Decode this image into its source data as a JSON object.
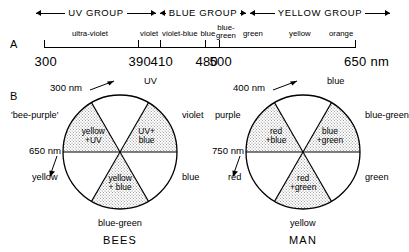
{
  "panels": {
    "a_label": "A",
    "b_label": "B"
  },
  "spectrum": {
    "groups": [
      {
        "name": "uv-group",
        "label": "UV GROUP",
        "left": 36,
        "width": 120
      },
      {
        "name": "blue-group",
        "label": "BLUE GROUP",
        "left": 160,
        "width": 86
      },
      {
        "name": "yellow-group",
        "label": "YELLOW GROUP",
        "left": 250,
        "width": 140
      }
    ],
    "bands": [
      {
        "name": "ultra-violet",
        "label": "ultra-violet",
        "center": 90
      },
      {
        "name": "violet",
        "label": "violet",
        "center": 149
      },
      {
        "name": "violet-blue",
        "label": "violet-blue",
        "center": 180
      },
      {
        "name": "blue",
        "label": "blue",
        "center": 208
      },
      {
        "name": "blue-green",
        "label": "blue-<br>green",
        "center": 226
      },
      {
        "name": "green",
        "label": "green",
        "center": 253
      },
      {
        "name": "yellow",
        "label": "yellow",
        "center": 300
      },
      {
        "name": "orange",
        "label": "orange",
        "center": 341
      }
    ],
    "ticks": [
      {
        "name": "tick-300",
        "value": "300",
        "x": 44
      },
      {
        "name": "tick-390",
        "value": "390",
        "x": 138
      },
      {
        "name": "tick-410",
        "value": "410",
        "x": 160
      },
      {
        "name": "tick-480",
        "value": "480",
        "x": 205
      },
      {
        "name": "tick-500",
        "value": "500",
        "x": 219
      },
      {
        "name": "tick-650",
        "value": "650 nm",
        "x": 355
      }
    ]
  },
  "wheels": [
    {
      "name": "bees",
      "title": "BEES",
      "sectors": [
        {
          "name": "sector-yellow-plus-uv",
          "label": "yellow<br>+UV"
        },
        {
          "name": "sector-uv-plus-blue",
          "label": "UV+<br>blue"
        },
        {
          "name": "sector-yellow-plus-blue",
          "label": "yellow<br>+ blue"
        }
      ],
      "outer": {
        "top": {
          "name": "label-uv",
          "text": "UV"
        },
        "upper_left": {
          "name": "label-bee-purple",
          "text": "'bee-purple'"
        },
        "upper_right": {
          "name": "label-violet",
          "text": "violet"
        },
        "lower_left": {
          "name": "label-yellow",
          "text": "yellow"
        },
        "lower_right": {
          "name": "label-blue",
          "text": "blue"
        },
        "bottom": {
          "name": "label-blue-green",
          "text": "blue-green"
        }
      },
      "nm_top": {
        "name": "nm-300",
        "text": "300 nm"
      },
      "nm_left": {
        "name": "nm-650",
        "text": "650 nm"
      }
    },
    {
      "name": "man",
      "title": "MAN",
      "sectors": [
        {
          "name": "sector-red-plus-blue",
          "label": "red<br>+blue"
        },
        {
          "name": "sector-blue-plus-green",
          "label": "blue<br>+green"
        },
        {
          "name": "sector-red-plus-green",
          "label": "red<br>+green"
        }
      ],
      "outer": {
        "top": {
          "name": "label-blue",
          "text": "blue"
        },
        "upper_left": {
          "name": "label-purple",
          "text": "purple"
        },
        "upper_right": {
          "name": "label-blue-green",
          "text": "blue-green"
        },
        "lower_left": {
          "name": "label-red",
          "text": "red"
        },
        "lower_right": {
          "name": "label-green",
          "text": "green"
        },
        "bottom": {
          "name": "label-yellow",
          "text": "yellow"
        }
      },
      "nm_top": {
        "name": "nm-400",
        "text": "400 nm"
      },
      "nm_left": {
        "name": "nm-750",
        "text": "750 nm"
      }
    }
  ]
}
